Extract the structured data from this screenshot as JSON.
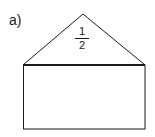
{
  "figure": {
    "label": "a)",
    "fraction": {
      "numerator": "1",
      "denominator": "2"
    },
    "shapes": {
      "triangle": {
        "apex": [
          83,
          14
        ],
        "base_left": [
          23,
          65
        ],
        "base_right": [
          145,
          65
        ]
      },
      "rectangle": {
        "x": 23,
        "y": 65,
        "width": 122,
        "height": 64
      }
    },
    "stroke_color": "#1a1a1a"
  }
}
